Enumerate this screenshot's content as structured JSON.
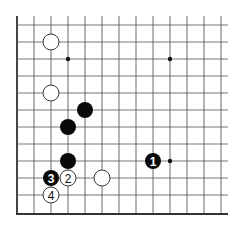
{
  "diagram": {
    "type": "go-board-fragment",
    "columns": 13,
    "rows": 12,
    "edges": [
      "left",
      "bottom"
    ],
    "star_points": [
      [
        3,
        2
      ],
      [
        9,
        2
      ],
      [
        9,
        8
      ]
    ],
    "stones": [
      {
        "color": "white",
        "col": 2,
        "row": 1,
        "label": ""
      },
      {
        "color": "white",
        "col": 2,
        "row": 4,
        "label": ""
      },
      {
        "color": "black",
        "col": 4,
        "row": 5,
        "label": ""
      },
      {
        "color": "black",
        "col": 3,
        "row": 6,
        "label": ""
      },
      {
        "color": "black",
        "col": 3,
        "row": 8,
        "label": ""
      },
      {
        "color": "black",
        "col": 8,
        "row": 8,
        "label": "1"
      },
      {
        "color": "white",
        "col": 3,
        "row": 9,
        "label": "2"
      },
      {
        "color": "black",
        "col": 2,
        "row": 9,
        "label": "3"
      },
      {
        "color": "white",
        "col": 5,
        "row": 9,
        "label": ""
      },
      {
        "color": "white",
        "col": 2,
        "row": 10,
        "label": "4"
      }
    ]
  }
}
